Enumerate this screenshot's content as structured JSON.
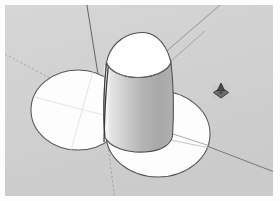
{
  "app": {
    "name": "3d-modeler-viewport",
    "title": "",
    "viewport_background": "#d2d2d2"
  },
  "viewport": {
    "label": "3D modelling viewport",
    "background_color": "#d2d2d2",
    "border_color": "#ffffff",
    "width": 268,
    "height": 191
  },
  "axes": {
    "label": "Model axes",
    "items": [
      {
        "name": "red-axis-positive",
        "color": "#6a6a6a",
        "style": "solid",
        "description": "axis running from centre toward lower-right"
      },
      {
        "name": "red-axis-negative",
        "color": "#9a9a9a",
        "style": "dotted",
        "description": "axis running from centre toward upper-left"
      },
      {
        "name": "green-axis-positive",
        "color": "#8a8a8a",
        "style": "solid",
        "description": "axis running from centre toward upper-right"
      },
      {
        "name": "blue-axis-positive",
        "color": "#5c5c5c",
        "style": "solid",
        "description": "vertical axis running up from origin"
      },
      {
        "name": "blue-axis-negative",
        "color": "#9a9a9a",
        "style": "dotted",
        "description": "vertical axis running down from origin"
      }
    ]
  },
  "geometry": {
    "label": "Model geometry",
    "objects": [
      {
        "name": "cylinder",
        "kind": "cylinder",
        "top_face_color": "#fefefe",
        "side_face_color": "#b4b4b4",
        "edge_color": "#4b4b4b",
        "description": "upright cylinder standing on the ground plane at the origin"
      },
      {
        "name": "left-circle",
        "kind": "circle",
        "fill_color": "#fdfdfd",
        "edge_color": "#5a5a5a",
        "description": "flat circle on the ground plane, left of the cylinder"
      },
      {
        "name": "right-circle",
        "kind": "circle",
        "fill_color": "#fdfdfd",
        "edge_color": "#5a5a5a",
        "description": "flat circle on the ground plane, lower-right of the cylinder"
      }
    ]
  },
  "cursor": {
    "label": "Tool cursor",
    "icon": "push-pull-cursor-icon",
    "x": 221,
    "y": 92,
    "color": "#4a4a4a"
  }
}
